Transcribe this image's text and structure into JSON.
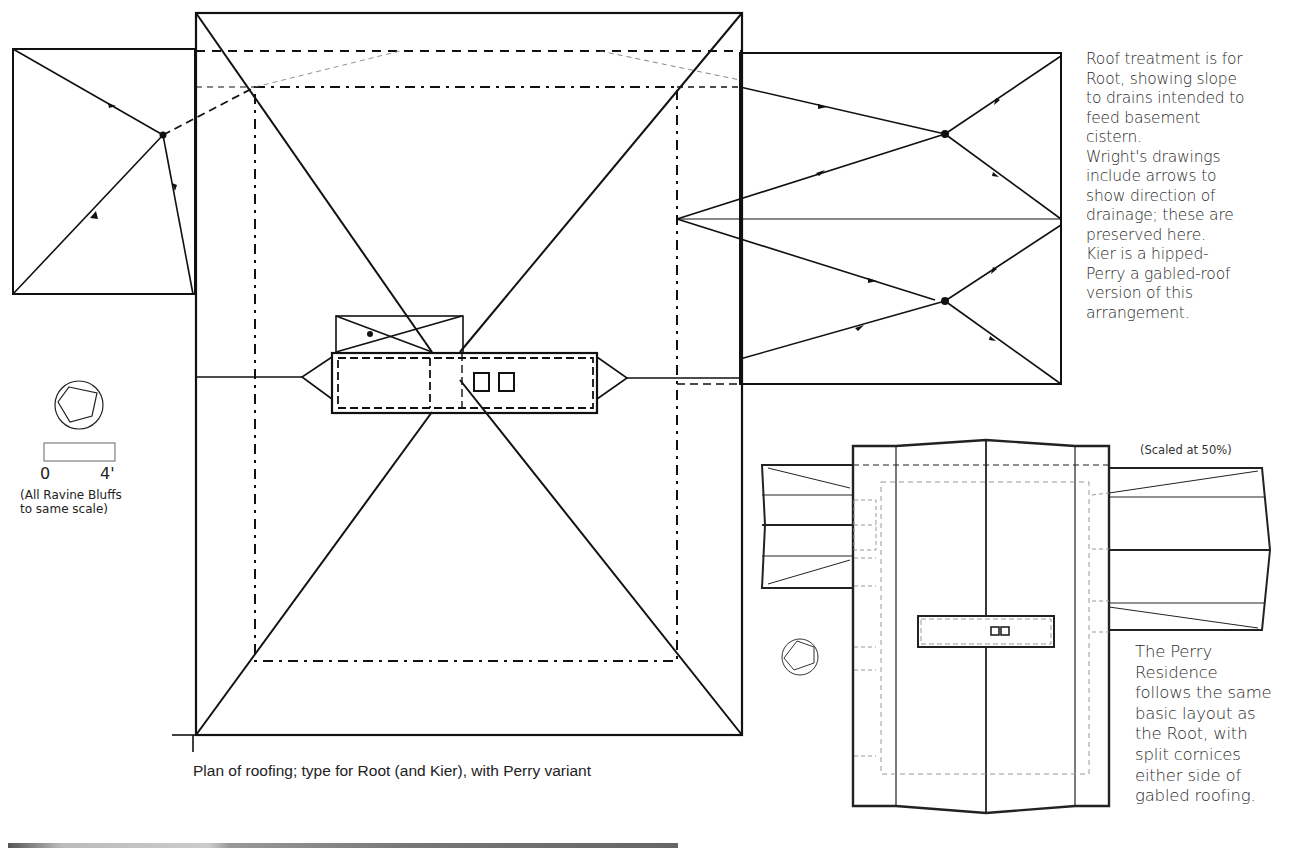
{
  "figure": {
    "caption": "Plan of roofing; type for Root (and Kier), with Perry variant",
    "root_note": "Roof treatment is for\nRoot, showing slope\nto drains intended to\nfeed basement\ncistern.\nWright's drawings\ninclude arrows to\nshow direction of\ndrainage; these are\npreserved here.\nKier is a hipped-\nPerry a gabled-roof\nversion of this\narrangement.",
    "perry_note": "The Perry\nResidence\nfollows the same\nbasic layout as\nthe Root, with\nsplit cornices\neither side of\ngabled roofing.",
    "perry_scale_label": "(Scaled at 50%)",
    "scale_bar": {
      "start_label": "0",
      "end_label": "4'",
      "note": "(All Ravine Bluffs\nto same scale)"
    },
    "icons": [
      "north-compass-icon",
      "north-compass-icon-small"
    ]
  },
  "colors": {
    "ink": "#111111",
    "light_ink": "#777777",
    "paper": "#ffffff"
  }
}
